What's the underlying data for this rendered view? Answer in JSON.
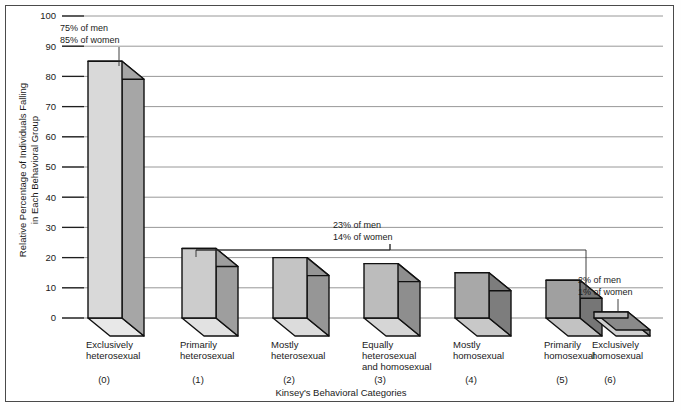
{
  "chart_data": {
    "type": "bar",
    "title": "",
    "xlabel": "Kinsey's Behavioral Categories",
    "ylabel_line1": "Relative Percentage of Individuals Falling",
    "ylabel_line2": "in Each Behavioral Group",
    "ylim": [
      0,
      100
    ],
    "yticks": [
      0,
      10,
      20,
      30,
      40,
      50,
      60,
      70,
      80,
      90,
      100
    ],
    "ytick_labels": [
      "0",
      "10",
      "20",
      "30",
      "40",
      "50",
      "60",
      "70",
      "80",
      "90",
      "100"
    ],
    "grid": true,
    "legend": "none",
    "categories": [
      "Exclusively heterosexual",
      "Primarily heterosexual",
      "Mostly heterosexual",
      "Equally heterosexual and homosexual",
      "Mostly homosexual",
      "Primarily homosexual",
      "Exclusively homosexual"
    ],
    "category_lines": [
      [
        "Exclusively",
        "heterosexual"
      ],
      [
        "Primarily",
        "heterosexual"
      ],
      [
        "Mostly",
        "heterosexual"
      ],
      [
        "Equally",
        "heterosexual",
        "and homosexual"
      ],
      [
        "Mostly",
        "homosexual"
      ],
      [
        "Primarily",
        "homosexual"
      ],
      [
        "Exclusively",
        "homosexual"
      ]
    ],
    "category_codes": [
      "(0)",
      "(1)",
      "(2)",
      "(3)",
      "(4)",
      "(5)",
      "(6)"
    ],
    "values": [
      85,
      23,
      20,
      18,
      15,
      12.5,
      2
    ],
    "bar_front_colors": [
      "#d9d9d9",
      "#cccccc",
      "#c4c4c4",
      "#bcbcbc",
      "#a8a8a8",
      "#a0a0a0",
      "#b4b4b4"
    ],
    "bar_side_colors": [
      "#a6a6a6",
      "#9e9e9e",
      "#969696",
      "#8e8e8e",
      "#7d7d7d",
      "#767676",
      "#8a8a8a"
    ],
    "bar_top_colors": [
      "#e8e8e8",
      "#e2e2e2",
      "#dcdcdc",
      "#d6d6d6",
      "#c8c8c8",
      "#c2c2c2",
      "#d0d0d0"
    ],
    "annotations": [
      {
        "id": "annotation-bar0",
        "line1": "75% of men",
        "line2": "85% of women",
        "target_category": 0
      },
      {
        "id": "annotation-bracket",
        "line1": "23% of men",
        "line2": "14% of women",
        "target_range": [
          1,
          5
        ]
      },
      {
        "id": "annotation-bar6",
        "line1": "2% of men",
        "line2": "1% of women",
        "target_category": 6
      }
    ]
  },
  "colors": {
    "frame": "#4a4a4a",
    "gridline": "#8c8c8c",
    "outline": "#111111",
    "text": "#1a1a1a",
    "background": "#ffffff"
  }
}
